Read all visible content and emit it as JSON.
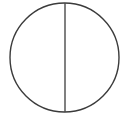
{
  "canvas": {
    "width": 132,
    "height": 127,
    "background_color": "#ffffff",
    "title": "Circle divided by a vertical diameter"
  },
  "figure": {
    "name": "bisected-circle",
    "stroke_color": "#3b3b3b",
    "fill_color": "none",
    "shapes": [
      {
        "id": "circle-outline",
        "type": "ellipse",
        "center_x": 64.5,
        "center_y": 57.5,
        "radius_x": 54.5,
        "radius_y": 54.5,
        "stroke_color": "#3b3b3b",
        "stroke_width": 1.4,
        "fill": "none"
      },
      {
        "id": "vertical-diameter",
        "type": "line",
        "x1": 65,
        "y1": 3,
        "x2": 65,
        "y2": 112,
        "stroke_color": "#4a4a4a",
        "stroke_width": 1.4
      }
    ]
  }
}
